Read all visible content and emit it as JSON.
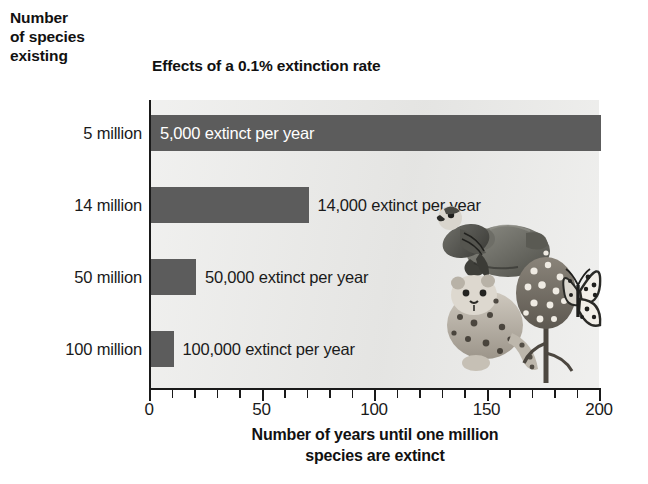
{
  "chart_data": {
    "type": "bar",
    "orientation": "horizontal",
    "title": "Effects of a 0.1% extinction rate",
    "ylabel_lines": [
      "Number",
      "of species",
      "existing"
    ],
    "xlabel_lines": [
      "Number of years until one million",
      "species are extinct"
    ],
    "categories": [
      "5 million",
      "14 million",
      "50 million",
      "100 million"
    ],
    "values": [
      200,
      70,
      20,
      10
    ],
    "data_labels": [
      "5,000 extinct per year",
      "14,000 extinct per year",
      "50,000 extinct per year",
      "100,000 extinct per year"
    ],
    "label_placement": [
      "inside",
      "outside",
      "outside",
      "outside"
    ],
    "xlim": [
      0,
      200
    ],
    "xticks_major": [
      0,
      50,
      100,
      150,
      200
    ],
    "xtick_labels": [
      "0",
      "50",
      "100",
      "150",
      "200"
    ],
    "xtick_minor_step": 10,
    "grid": false,
    "legend": "none",
    "bar_color": "#5c5c5c",
    "plot_background": "#e9e9e7",
    "text_color": "#1a1a1a"
  },
  "illustration": {
    "name": "endangered-species-collage",
    "elements": [
      "bird",
      "tree-frog",
      "leopard",
      "butterfly",
      "flowering-plant"
    ]
  }
}
